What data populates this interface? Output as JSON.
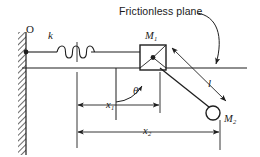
{
  "diagram": {
    "type": "mechanics-free-body-diagram",
    "canvas": {
      "width": 260,
      "height": 157,
      "background": "#ffffff"
    },
    "stroke_color": "#1f1f1f",
    "labels": {
      "frictionless_plane": "Frictionless plane",
      "origin": "O",
      "spring_constant": "k",
      "mass_one": "M",
      "mass_one_sub": "1",
      "mass_two": "M",
      "mass_two_sub": "2",
      "rod_length": "l",
      "angle": "θ",
      "displacement_one": "x",
      "displacement_one_sub": "1",
      "displacement_two": "x",
      "displacement_two_sub": "2"
    },
    "elements": {
      "wall": {
        "name": "fixed-hatched-wall",
        "x": 18,
        "y": 32,
        "width": 8,
        "height": 123
      },
      "plane_line": {
        "name": "frictionless-plane-line",
        "y": 68,
        "x_start": 22,
        "x_end": 246
      },
      "spring": {
        "name": "spring-coil",
        "x_start": 58,
        "x_end": 92,
        "y": 52,
        "coils": 4
      },
      "spring_rod_left": {
        "x_start": 26,
        "x_end": 58,
        "y": 52
      },
      "spring_rod_right": {
        "x_start": 92,
        "x_end": 140,
        "y": 52
      },
      "anchor_dot": {
        "cx": 26,
        "cy": 52,
        "r": 2.4
      },
      "block_m1": {
        "name": "mass-one-block",
        "x": 140,
        "y": 45,
        "width": 26,
        "height": 25
      },
      "block_center_dot": {
        "cx": 153,
        "cy": 57.5,
        "r": 2.4
      },
      "pivot_point": {
        "cx": 160,
        "cy": 68
      },
      "bob_m2": {
        "name": "mass-two-bob",
        "cx": 213,
        "cy": 113,
        "r": 7
      },
      "rod": {
        "name": "pendulum-rod",
        "x1": 160,
        "y1": 68,
        "x2": 209,
        "y2": 107
      },
      "vertical_ref_line": {
        "x": 116,
        "y_start": 68,
        "y_end": 120
      },
      "angle_arc": {
        "cx": 116,
        "cy": 68,
        "radius": 34,
        "from_deg": 270,
        "to_deg": 322
      },
      "ext_line_left": {
        "x": 77,
        "y_start": 42,
        "y_end": 148
      },
      "ext_line_mid": {
        "x": 160,
        "y_start": 70,
        "y_end": 113
      },
      "ext_line_right": {
        "x": 220,
        "y_start": 120,
        "y_end": 150
      },
      "dim_x1": {
        "y": 105,
        "x_start": 77,
        "x_end": 160
      },
      "dim_x2": {
        "y": 132,
        "x_start": 77,
        "x_end": 220
      },
      "dim_l": {
        "x1": 171,
        "y1": 47,
        "x2": 225,
        "y2": 100
      },
      "leader_frictionless": {
        "start_x": 196,
        "start_y": 12,
        "end_x": 216,
        "end_y": 66
      }
    }
  }
}
